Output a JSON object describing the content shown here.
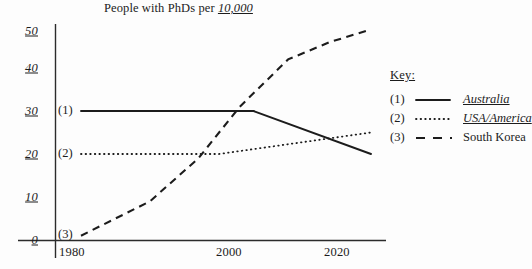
{
  "chart_data": {
    "type": "line",
    "title": "People with PhDs per 10,000",
    "title_plain": "People with PhDs per ",
    "title_emphasis": "10,000",
    "xlabel": "",
    "ylabel": "",
    "xlim": [
      1980,
      2022
    ],
    "ylim": [
      0,
      50
    ],
    "grid": false,
    "legend_position": "right",
    "legend_title": "Key:",
    "x_ticks": [
      "1980",
      "2000",
      "2020"
    ],
    "x_tick_values": [
      1980,
      2000,
      2020
    ],
    "y_ticks": [
      "0",
      "10",
      "20",
      "30",
      "40",
      "50"
    ],
    "y_tick_values": [
      0,
      10,
      20,
      30,
      40,
      50
    ],
    "series": [
      {
        "index": "(1)",
        "name": "Australia",
        "style": "solid",
        "emphasis": true,
        "x": [
          1980,
          2005,
          2022
        ],
        "values": [
          30,
          30,
          20
        ]
      },
      {
        "index": "(2)",
        "name": "USA/America",
        "style": "dotted",
        "emphasis": true,
        "x": [
          1980,
          2000,
          2022
        ],
        "values": [
          20,
          20,
          25
        ]
      },
      {
        "index": "(3)",
        "name": "South Korea",
        "style": "dashed",
        "emphasis": false,
        "x": [
          1980,
          1990,
          1997,
          2003,
          2010,
          2016,
          2022
        ],
        "values": [
          1,
          9,
          19,
          31,
          42,
          46,
          49
        ]
      }
    ]
  },
  "axis_tags": {
    "tag1": "(1)",
    "tag2": "(2)",
    "tag3": "(3)"
  }
}
